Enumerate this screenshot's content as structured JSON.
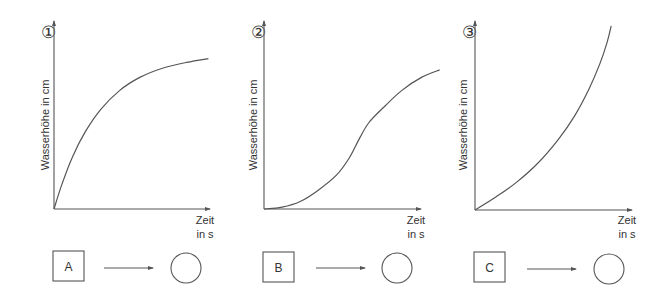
{
  "colors": {
    "line": "#555555",
    "text": "#333333",
    "background": "#ffffff"
  },
  "chart_data": [
    {
      "type": "line",
      "number_label": "①",
      "ylabel": "Wasserhöhe in cm",
      "xlabel_line1": "Zeit",
      "xlabel_line2": "in s",
      "grid": false,
      "xlim": [
        0,
        1
      ],
      "ylim": [
        0,
        1
      ],
      "x": [
        0,
        0.05,
        0.12,
        0.2,
        0.3,
        0.42,
        0.55,
        0.7,
        0.85,
        0.99
      ],
      "y": [
        0,
        0.13,
        0.28,
        0.41,
        0.53,
        0.63,
        0.7,
        0.75,
        0.78,
        0.8
      ],
      "shape": "concave rising (saturating)",
      "box_label": "A"
    },
    {
      "type": "line",
      "number_label": "②",
      "ylabel": "Wasserhöhe in cm",
      "xlabel_line1": "Zeit",
      "xlabel_line2": "in s",
      "grid": false,
      "xlim": [
        0,
        1
      ],
      "ylim": [
        0,
        1
      ],
      "x": [
        0,
        0.1,
        0.2,
        0.3,
        0.4,
        0.47,
        0.53,
        0.58,
        0.66,
        0.76,
        0.87,
        0.97
      ],
      "y": [
        0,
        0.01,
        0.04,
        0.1,
        0.18,
        0.27,
        0.38,
        0.46,
        0.54,
        0.63,
        0.7,
        0.74
      ],
      "shape": "S-shaped rising with a kink",
      "box_label": "B"
    },
    {
      "type": "line",
      "number_label": "③",
      "ylabel": "Wasserhöhe in cm",
      "xlabel_line1": "Zeit",
      "xlabel_line2": "in s",
      "grid": false,
      "xlim": [
        0,
        1
      ],
      "ylim": [
        0,
        1
      ],
      "x": [
        0,
        0.15,
        0.3,
        0.45,
        0.6,
        0.72,
        0.82,
        0.9,
        0.95,
        0.98
      ],
      "y": [
        0,
        0.07,
        0.15,
        0.25,
        0.38,
        0.51,
        0.65,
        0.79,
        0.9,
        0.99
      ],
      "shape": "convex rising (accelerating)",
      "box_label": "C"
    }
  ]
}
